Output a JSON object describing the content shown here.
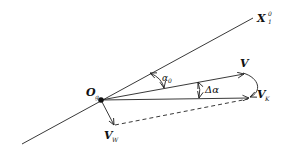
{
  "diagram": {
    "type": "vector-diagram",
    "labels": {
      "axis": "X",
      "axis_sup": "0",
      "axis_sub": "1",
      "origin": "O",
      "origin_sub": "g",
      "v": "V",
      "vk": "V",
      "vk_sub": "K",
      "vw": "V",
      "vw_sub": "W",
      "alpha0": "α",
      "alpha0_sub": "0",
      "delta_alpha": "Δα"
    },
    "colors": {
      "line": "#222222",
      "background": "#ffffff"
    }
  }
}
